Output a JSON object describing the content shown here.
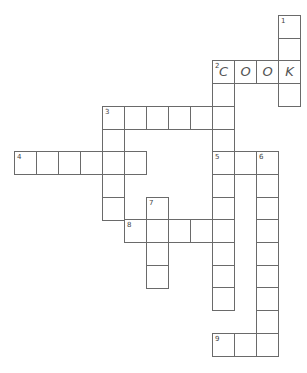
{
  "puzzle": {
    "type": "crossword",
    "clue_numbers": [
      "1",
      "2",
      "3",
      "4",
      "5",
      "6",
      "7",
      "8",
      "9"
    ],
    "filled": {
      "2_across": "COOK"
    },
    "entries": [
      {
        "number": "1",
        "direction": "down",
        "length": 4,
        "letters": [
          "",
          "",
          "K",
          ""
        ]
      },
      {
        "number": "2",
        "direction": "across",
        "length": 4,
        "letters": [
          "C",
          "O",
          "O",
          "K"
        ]
      },
      {
        "number": "2",
        "direction": "down",
        "length": 11,
        "letters": [
          "C",
          "",
          "",
          "",
          "",
          "",
          "",
          "",
          "",
          "",
          ""
        ]
      },
      {
        "number": "3",
        "direction": "across",
        "length": 6,
        "letters": [
          "",
          "",
          "",
          "",
          "",
          ""
        ]
      },
      {
        "number": "3",
        "direction": "down",
        "length": 5,
        "letters": [
          "",
          "",
          "",
          "",
          ""
        ]
      },
      {
        "number": "4",
        "direction": "across",
        "length": 6,
        "letters": [
          "",
          "",
          "",
          "",
          "",
          ""
        ]
      },
      {
        "number": "5",
        "direction": "across",
        "length": 3,
        "letters": [
          "",
          "",
          ""
        ]
      },
      {
        "number": "6",
        "direction": "down",
        "length": 9,
        "letters": [
          "",
          "",
          "",
          "",
          "",
          "",
          "",
          "",
          ""
        ]
      },
      {
        "number": "7",
        "direction": "down",
        "length": 4,
        "letters": [
          "",
          "",
          "",
          ""
        ]
      },
      {
        "number": "8",
        "direction": "across",
        "length": 5,
        "letters": [
          "",
          "",
          "",
          "",
          ""
        ]
      },
      {
        "number": "9",
        "direction": "across",
        "length": 3,
        "letters": [
          "",
          "",
          ""
        ]
      }
    ]
  }
}
